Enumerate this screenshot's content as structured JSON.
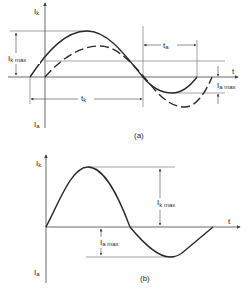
{
  "diagram_a": {
    "caption": "(a)",
    "y_axis_top_label": "I",
    "y_axis_top_sub": "k",
    "y_axis_bottom_label": "I",
    "y_axis_bottom_sub": "a",
    "x_axis_label": "t",
    "ik_max_label": "I",
    "ik_max_sub": "k max",
    "ia_max_label": "I",
    "ia_max_sub": "a max",
    "tk_label": "t",
    "tk_sub": "k",
    "ta_label": "t",
    "ta_sub": "a",
    "series": [
      {
        "name": "solid-waveform",
        "style": "solid"
      },
      {
        "name": "dashed-waveform",
        "style": "dashed"
      }
    ]
  },
  "diagram_b": {
    "caption": "(b)",
    "y_axis_top_label": "I",
    "y_axis_top_sub": "k",
    "y_axis_bottom_label": "I",
    "y_axis_bottom_sub": "a",
    "x_axis_label": "t",
    "ik_max_label": "I",
    "ik_max_sub": "k max",
    "ia_max_label": "I",
    "ia_max_sub": "a max"
  },
  "colors": {
    "ink": "#2a2a2a",
    "thin": "#555555",
    "background": "#ffffff"
  }
}
